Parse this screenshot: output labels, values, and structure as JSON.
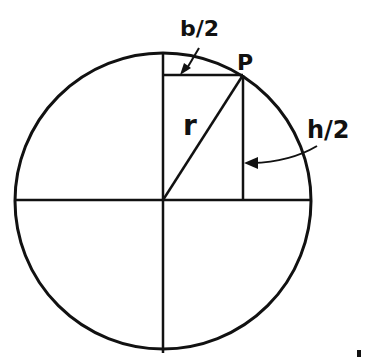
{
  "diagram": {
    "labels": {
      "b_half": "b/2",
      "point": "P",
      "radius": "r",
      "h_half": "h/2"
    },
    "colors": {
      "stroke": "#111111",
      "background": "#ffffff"
    },
    "circle": {
      "cx": 163,
      "cy": 200,
      "r": 148
    },
    "point_p": {
      "x": 243,
      "y": 75
    }
  }
}
